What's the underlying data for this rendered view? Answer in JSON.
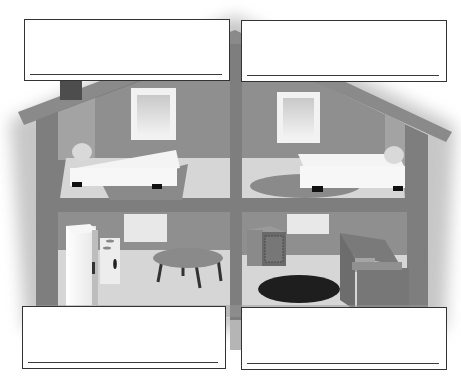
{
  "worksheet": {
    "subject": "dollhouse cutaway with four rooms",
    "colors": {
      "wall_dark": "#8f8f8f",
      "wall_side": "#a3a3a3",
      "frame": "#7e7e7e",
      "floor": "#d6d6d6",
      "rug": "#8a8a8a",
      "dark_rug": "#1e1e1e",
      "bed": "#f4f4f4",
      "window_frame": "#f2f2f2",
      "box_border": "#333333"
    },
    "rooms": [
      {
        "id": "top-left",
        "name": "bedroom",
        "items": [
          "window",
          "bed",
          "pillow",
          "rectangular rug"
        ]
      },
      {
        "id": "top-right",
        "name": "bedroom",
        "items": [
          "window",
          "bed",
          "pillow",
          "oval rug"
        ]
      },
      {
        "id": "bottom-left",
        "name": "kitchen",
        "items": [
          "window",
          "refrigerator",
          "stove",
          "round table"
        ]
      },
      {
        "id": "bottom-right",
        "name": "living room",
        "items": [
          "window",
          "stereo/heater cabinet",
          "black round rug",
          "armchair"
        ]
      }
    ],
    "answer_boxes": [
      {
        "id": "top-left",
        "value": ""
      },
      {
        "id": "top-right",
        "value": ""
      },
      {
        "id": "bottom-left",
        "value": ""
      },
      {
        "id": "bottom-right",
        "value": ""
      }
    ]
  }
}
